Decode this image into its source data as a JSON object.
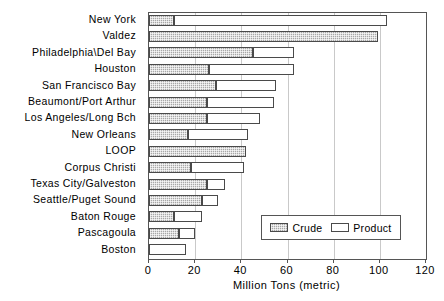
{
  "chart_data": {
    "type": "bar",
    "orientation": "horizontal",
    "stacked": true,
    "title": "",
    "xlabel": "Million Tons (metric)",
    "ylabel": "",
    "xlim": [
      0,
      120
    ],
    "xticks": [
      0,
      20,
      40,
      60,
      80,
      100,
      120
    ],
    "xtick_labels": [
      "0",
      "20",
      "40",
      "60",
      "80",
      "100",
      "120"
    ],
    "grid": "vertical",
    "legend_position": "lower-right",
    "categories": [
      "New York",
      "Valdez",
      "Philadelphia\\Del Bay",
      "Houston",
      "San Francisco Bay",
      "Beaumont/Port Arthur",
      "Los Angeles/Long Bch",
      "New Orleans",
      "LOOP",
      "Corpus Christi",
      "Texas City/Galveston",
      "Seattle/Puget Sound",
      "Baton Rouge",
      "Pascagoula",
      "Boston"
    ],
    "series": [
      {
        "name": "Crude",
        "color": "#a8a8a8",
        "pattern": "checkered",
        "values": [
          11,
          99,
          45,
          26,
          29,
          25,
          25,
          17,
          42,
          18,
          25,
          23,
          11,
          13,
          0
        ]
      },
      {
        "name": "Product",
        "color": "#ffffff",
        "pattern": "solid",
        "values": [
          92,
          0,
          18,
          37,
          26,
          29,
          23,
          26,
          0,
          23,
          8,
          7,
          12,
          7,
          16
        ]
      }
    ],
    "totals": [
      103,
      99,
      63,
      63,
      55,
      54,
      48,
      43,
      42,
      41,
      33,
      30,
      23,
      20,
      16
    ]
  },
  "legend": {
    "entries": [
      {
        "label": "Crude"
      },
      {
        "label": "Product"
      }
    ]
  },
  "colors": {
    "crude_fill": "#a8a8a8",
    "product_fill": "#ffffff",
    "bar_outline": "#4a4a4a",
    "gridline": "#c9c9c9",
    "axis": "#555555"
  }
}
